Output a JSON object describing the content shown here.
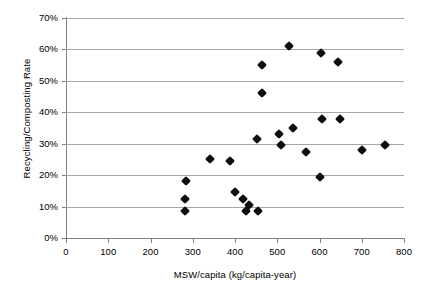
{
  "chart_data": {
    "type": "scatter",
    "title": "",
    "xlabel": "MSW/capita (kg/capita-year)",
    "ylabel": "Recycling/Composting Rate",
    "xlim": [
      0,
      800
    ],
    "ylim": [
      0,
      0.7
    ],
    "grid": true,
    "legend": false,
    "x_tick_labels": [
      "0",
      "100",
      "200",
      "300",
      "400",
      "500",
      "600",
      "700",
      "800"
    ],
    "x_ticks": [
      0,
      100,
      200,
      300,
      400,
      500,
      600,
      700,
      800
    ],
    "y_tick_labels": [
      "0%",
      "10%",
      "20%",
      "30%",
      "40%",
      "50%",
      "60%",
      "70%"
    ],
    "y_ticks": [
      0,
      10,
      20,
      30,
      40,
      50,
      60,
      70
    ],
    "marker": "diamond",
    "marker_color": "#0d0d0d",
    "points": [
      {
        "x": 281,
        "y": 8.5
      },
      {
        "x": 281,
        "y": 12.5
      },
      {
        "x": 283,
        "y": 18
      },
      {
        "x": 341,
        "y": 25
      },
      {
        "x": 388,
        "y": 24.5
      },
      {
        "x": 400,
        "y": 14.5
      },
      {
        "x": 420,
        "y": 12.5
      },
      {
        "x": 425,
        "y": 8.5
      },
      {
        "x": 432,
        "y": 10.5
      },
      {
        "x": 455,
        "y": 8.5
      },
      {
        "x": 452,
        "y": 31.5
      },
      {
        "x": 463,
        "y": 55
      },
      {
        "x": 465,
        "y": 46
      },
      {
        "x": 503,
        "y": 33
      },
      {
        "x": 509,
        "y": 29.5
      },
      {
        "x": 528,
        "y": 61
      },
      {
        "x": 538,
        "y": 35
      },
      {
        "x": 567,
        "y": 27.5
      },
      {
        "x": 600,
        "y": 19.5
      },
      {
        "x": 604,
        "y": 59
      },
      {
        "x": 606,
        "y": 38
      },
      {
        "x": 643,
        "y": 56
      },
      {
        "x": 648,
        "y": 38
      },
      {
        "x": 700,
        "y": 28
      },
      {
        "x": 754,
        "y": 29.5
      }
    ]
  },
  "axes": {
    "y_title": "Recycling/Composting Rate",
    "x_title": "MSW/capita (kg/capita-year)"
  }
}
